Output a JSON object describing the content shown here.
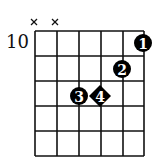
{
  "chord_diagram": {
    "start_fret_label": "10",
    "strings": 6,
    "frets": 5,
    "muted_strings": [
      1,
      2
    ],
    "muted_symbol": "×",
    "fingers": [
      {
        "label": "1",
        "string": 6,
        "fret": 1,
        "shape": "circle"
      },
      {
        "label": "2",
        "string": 5,
        "fret": 2,
        "shape": "circle"
      },
      {
        "label": "3",
        "string": 3,
        "fret": 3,
        "shape": "circle"
      },
      {
        "label": "4",
        "string": 4,
        "fret": 3,
        "shape": "diamond"
      }
    ],
    "colors": {
      "line": "#111111",
      "dot": "#000000",
      "dot_text": "#ffffff",
      "background": "#ffffff"
    }
  }
}
